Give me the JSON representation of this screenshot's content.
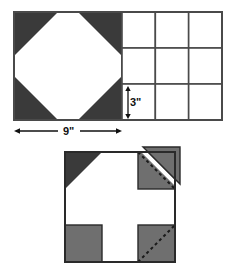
{
  "figure": {
    "background_color": "#ffffff",
    "outline_color": "#4a4a4a",
    "dark_fill_color": "#3a3a3a",
    "gray_fill_color": "#6f6f6f",
    "white_fill_color": "#ffffff",
    "dashed_color": "#1a1a1a"
  },
  "top_diagram": {
    "name": "octagon-and-grid",
    "square": {
      "name": "octagon-square",
      "x": 14,
      "y": 12,
      "size": 108,
      "description": "Square containing an inscribed octagon with four dark corner triangles"
    },
    "corner_triangles": [
      {
        "position": "top-left",
        "fill": "#3a3a3a"
      },
      {
        "position": "top-right",
        "fill": "#3a3a3a"
      },
      {
        "position": "bottom-left",
        "fill": "#3a3a3a"
      },
      {
        "position": "bottom-right",
        "fill": "#3a3a3a"
      }
    ],
    "grid": {
      "name": "three-by-three-grid",
      "x": 122,
      "y": 12,
      "width": 100,
      "height": 108,
      "columns": 3,
      "rows": 3,
      "cell_fill": "#ffffff"
    },
    "dimensions": [
      {
        "name": "height-dimension",
        "label": "3\"",
        "orientation": "vertical",
        "value": 3,
        "unit": "inch"
      },
      {
        "name": "width-dimension",
        "label": "9\"",
        "orientation": "horizontal",
        "value": 9,
        "unit": "inch"
      }
    ]
  },
  "bottom_diagram": {
    "name": "cross-block",
    "square": {
      "name": "cross-square",
      "x": 65,
      "y": 152,
      "size": 110,
      "description": "Square showing a white cross with gray corner squares and one corner triangle flipped outward"
    },
    "corners": [
      {
        "name": "corner-top-left",
        "position": "top-left",
        "shape": "triangle",
        "fill": "#3a3a3a",
        "dashed_diagonal": false,
        "flipped_out": false
      },
      {
        "name": "corner-top-right",
        "position": "top-right",
        "shape": "square-with-flipped-triangle",
        "fill": "#6f6f6f",
        "dashed_diagonal": true,
        "flipped_out": true
      },
      {
        "name": "corner-bottom-left",
        "position": "bottom-left",
        "shape": "square",
        "fill": "#6f6f6f",
        "dashed_diagonal": false,
        "flipped_out": false
      },
      {
        "name": "corner-bottom-right",
        "position": "bottom-right",
        "shape": "square",
        "fill": "#6f6f6f",
        "dashed_diagonal": true,
        "flipped_out": false
      }
    ]
  }
}
